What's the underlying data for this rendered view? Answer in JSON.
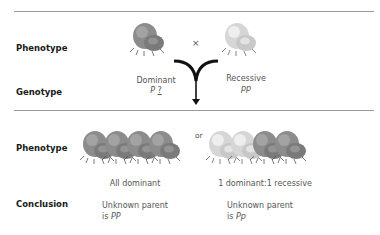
{
  "labels": {
    "phenotype_top": "Phenotype",
    "genotype": "Genotype",
    "phenotype_bottom": "Phenotype",
    "conclusion": "Conclusion"
  },
  "parents": {
    "cross_symbol": "×",
    "dominant": {
      "label": "Dominant",
      "genotype_prefix": "P",
      "genotype_unknown": "?"
    },
    "recessive": {
      "label": "Recessive",
      "genotype": "pp"
    }
  },
  "offspring": {
    "or_label": "or",
    "outcome_a": {
      "label": "All dominant",
      "conclusion_line1": "Unknown parent",
      "conclusion_line2_prefix": "is ",
      "conclusion_genotype": "PP"
    },
    "outcome_b": {
      "label": "1 dominant:1 recessive",
      "conclusion_line1": "Unknown parent",
      "conclusion_line2_prefix": "is ",
      "conclusion_genotype": "Pp"
    }
  },
  "colors": {
    "dominant_flower": "#8a8a8a",
    "recessive_flower": "#d8d8d8",
    "rule": "#9a9a9a",
    "arrow": "#111111"
  }
}
